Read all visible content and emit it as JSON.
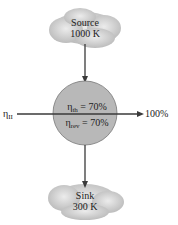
{
  "source": {
    "name": "Source",
    "temp": "1000 K"
  },
  "sink": {
    "name": "Sink",
    "temp": "300 K"
  },
  "engine": {
    "eta_th_sym": "η",
    "eta_th_sub": "th",
    "eta_th_val": " = 70%",
    "eta_rev_sym": "η",
    "eta_rev_sub": "rev",
    "eta_rev_val": " = 70%"
  },
  "axis": {
    "left_sym": "η",
    "left_sub": "II",
    "right_label": "100%"
  },
  "colors": {
    "cloud": "#c8c8c8",
    "circle": "#b4b4b4",
    "arrow": "#3a3a3a"
  }
}
